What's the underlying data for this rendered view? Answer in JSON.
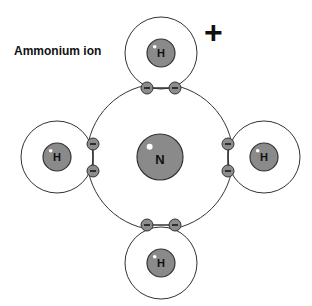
{
  "title": "Ammonium ion",
  "charge": "+",
  "colors": {
    "nucleus": "#8a8a8a",
    "electron": "#8c8c8c",
    "line": "#333333"
  },
  "central_atom": {
    "label": "N",
    "cx": 160,
    "cy": 157,
    "shell_r": 73,
    "nucleus_r": 23
  },
  "hydrogens": [
    {
      "label": "H",
      "position": "top",
      "cx": 161,
      "cy": 53
    },
    {
      "label": "H",
      "position": "left",
      "cx": 57,
      "cy": 157
    },
    {
      "label": "H",
      "position": "right",
      "cx": 264,
      "cy": 157
    },
    {
      "label": "H",
      "position": "bottom",
      "cx": 161,
      "cy": 263
    }
  ],
  "electron_symbol": "−",
  "electrons": [
    {
      "x": 147,
      "y": 88
    },
    {
      "x": 175,
      "y": 88
    },
    {
      "x": 93,
      "y": 144
    },
    {
      "x": 93,
      "y": 171
    },
    {
      "x": 228,
      "y": 144
    },
    {
      "x": 228,
      "y": 171
    },
    {
      "x": 147,
      "y": 225
    },
    {
      "x": 175,
      "y": 225
    }
  ]
}
